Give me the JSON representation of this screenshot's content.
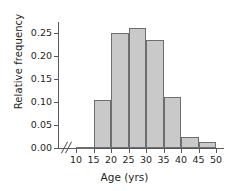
{
  "chart_data": {
    "type": "bar",
    "title": "",
    "subtitle": "",
    "xlabel": "Age (yrs)",
    "ylabel": "Relative frequency",
    "grid": false,
    "legend": null,
    "bin_width": 5,
    "xlim": [
      10,
      52
    ],
    "ylim": [
      0.0,
      0.275
    ],
    "x_tick_labels": [
      "10",
      "15",
      "20",
      "25",
      "30",
      "35",
      "40",
      "45",
      "50"
    ],
    "x_tick_values": [
      10,
      15,
      20,
      25,
      30,
      35,
      40,
      45,
      50
    ],
    "y_tick_labels": [
      "0.00",
      "0.05",
      "0.10",
      "0.15",
      "0.20",
      "0.25"
    ],
    "y_tick_values": [
      0.0,
      0.05,
      0.1,
      0.15,
      0.2,
      0.25
    ],
    "axis_break": true,
    "axis_break_symbol": "//",
    "bin_labels": [
      "10-15",
      "15-20",
      "20-25",
      "25-30",
      "30-35",
      "35-40",
      "40-45",
      "45-50"
    ],
    "categories": [
      "10-15",
      "15-20",
      "20-25",
      "25-30",
      "30-35",
      "35-40",
      "40-45",
      "45-50"
    ],
    "bin_starts": [
      10,
      15,
      20,
      25,
      30,
      35,
      40,
      45
    ],
    "bin_ends": [
      15,
      20,
      25,
      30,
      35,
      40,
      45,
      50
    ],
    "values": [
      0.002,
      0.105,
      0.251,
      0.26,
      0.234,
      0.111,
      0.023,
      0.012
    ],
    "bar_fill_color": "#c9c9c9",
    "bar_edge_color": "#6d6e71",
    "axis_color": "#58595b",
    "text_color": "#231f20",
    "background_color": "#ffffff"
  }
}
